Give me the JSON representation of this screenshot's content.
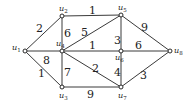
{
  "diagram": {
    "type": "weighted-undirected-graph",
    "nodes": [
      {
        "id": "u1",
        "label": "u",
        "sub": "1",
        "x": 25,
        "y": 51
      },
      {
        "id": "u2",
        "label": "u",
        "sub": "2",
        "x": 62,
        "y": 16
      },
      {
        "id": "u3",
        "label": "u",
        "sub": "3",
        "x": 62,
        "y": 87
      },
      {
        "id": "u4",
        "label": "u",
        "sub": "4",
        "x": 62,
        "y": 51
      },
      {
        "id": "u5",
        "label": "u",
        "sub": "5",
        "x": 121,
        "y": 15
      },
      {
        "id": "u6",
        "label": "u",
        "sub": "6",
        "x": 121,
        "y": 51
      },
      {
        "id": "u7",
        "label": "u",
        "sub": "7",
        "x": 121,
        "y": 87
      },
      {
        "id": "u8",
        "label": "u",
        "sub": "8",
        "x": 170,
        "y": 51
      }
    ],
    "edges": [
      {
        "from": "u1",
        "to": "u2",
        "weight": "2"
      },
      {
        "from": "u1",
        "to": "u4",
        "weight": "8"
      },
      {
        "from": "u1",
        "to": "u3",
        "weight": "1"
      },
      {
        "from": "u2",
        "to": "u5",
        "weight": "1"
      },
      {
        "from": "u2",
        "to": "u4",
        "weight": "6"
      },
      {
        "from": "u4",
        "to": "u5",
        "weight": "5"
      },
      {
        "from": "u4",
        "to": "u6",
        "weight": "1"
      },
      {
        "from": "u4",
        "to": "u7",
        "weight": "2"
      },
      {
        "from": "u4",
        "to": "u3",
        "weight": "7"
      },
      {
        "from": "u3",
        "to": "u7",
        "weight": "9"
      },
      {
        "from": "u5",
        "to": "u6",
        "weight": "3"
      },
      {
        "from": "u5",
        "to": "u8",
        "weight": "9"
      },
      {
        "from": "u6",
        "to": "u8",
        "weight": "6"
      },
      {
        "from": "u6",
        "to": "u7",
        "weight": "4"
      },
      {
        "from": "u7",
        "to": "u8",
        "weight": "3"
      }
    ]
  }
}
